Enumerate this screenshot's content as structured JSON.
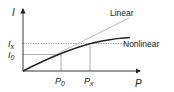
{
  "diagram": {
    "y_axis_label": "I",
    "x_axis_label": "P",
    "y_ticks": [
      {
        "main": "I",
        "sub": "x"
      },
      {
        "main": "I",
        "sub": "0"
      }
    ],
    "x_ticks": [
      {
        "main": "P",
        "sub": "0"
      },
      {
        "main": "P",
        "sub": "x"
      }
    ],
    "curves": [
      {
        "name": "Linear",
        "label": "Linear",
        "color": "#aaaaaa"
      },
      {
        "name": "Nonlinear",
        "label": "Nonlinear",
        "color": "#222222"
      }
    ]
  }
}
